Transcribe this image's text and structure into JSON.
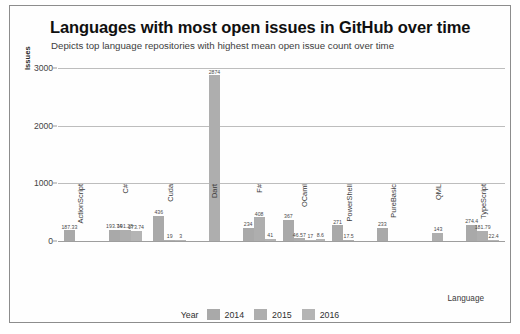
{
  "chart_data": {
    "type": "bar",
    "title": "Languages with most open issues in GitHub over time",
    "subtitle": "Depicts top language repositories with highest mean open issue count over time",
    "xlabel": "Language",
    "ylabel": "Issues",
    "ylim": [
      0,
      3000
    ],
    "yticks": [
      0,
      1000,
      2000,
      3000
    ],
    "grid": true,
    "legend_title": "Year",
    "legend_position": "bottom",
    "categories": [
      "ActionScript",
      "C#",
      "Cuda",
      "Dart",
      "F#",
      "OCaml",
      "PowerShell",
      "PureBasic",
      "QML",
      "TypeScript"
    ],
    "series": [
      {
        "name": "2014",
        "color": "#a9a9a9",
        "values": [
          187.33,
          193.74,
          436,
          null,
          234,
          367,
          271,
          233,
          null,
          274.4
        ]
      },
      {
        "name": "2015",
        "color": "#aeaeae",
        "values": [
          null,
          191.28,
          19,
          2874,
          408,
          46.57,
          17.5,
          null,
          143,
          181.79
        ]
      },
      {
        "name": "2016",
        "color": "#b4b4b4",
        "values": [
          null,
          173.74,
          3,
          null,
          41,
          17,
          null,
          null,
          null,
          22.4
        ]
      }
    ],
    "bar_labels": {
      "ActionScript": [
        "187.33",
        "",
        ""
      ],
      "C#": [
        "193.74",
        "191.28",
        "173.74"
      ],
      "Cuda": [
        "436",
        "19",
        "3"
      ],
      "Dart": [
        "",
        "2874",
        ""
      ],
      "F#": [
        "234",
        "408",
        "41"
      ],
      "OCaml": [
        "367",
        "46.57",
        "17"
      ],
      "PowerShell": [
        "271",
        "17.5",
        ""
      ],
      "PureBasic": [
        "233",
        "",
        ""
      ],
      "QML": [
        "",
        "143",
        ""
      ],
      "TypeScript": [
        "274.4",
        "181.79",
        "22.4"
      ]
    },
    "extra_small_bars": {
      "OCaml_trailing": "8.6"
    }
  }
}
